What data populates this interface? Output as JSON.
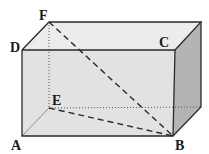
{
  "diagram": {
    "type": "rectangular-prism",
    "labels": {
      "A": "A",
      "B": "B",
      "C": "C",
      "D": "D",
      "E": "E",
      "F": "F"
    },
    "segments": [
      {
        "name": "FB",
        "style": "dashed"
      },
      {
        "name": "EB",
        "style": "dashed"
      },
      {
        "name": "FE",
        "style": "dotted"
      },
      {
        "name": "E-back-right",
        "style": "dotted"
      },
      {
        "name": "AE",
        "style": "thin"
      }
    ],
    "colors": {
      "front_face": "#e2e2e2",
      "top_face": "#ececec",
      "side_face": "#b4b4b4",
      "edge": "#2a2a2a"
    }
  }
}
